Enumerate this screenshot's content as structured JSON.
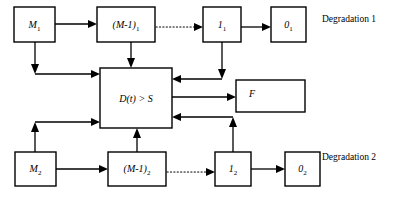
{
  "diagram": {
    "background_color": "#ffffff",
    "line_color": "#000000",
    "boxes": [
      {
        "id": "m1",
        "label": "M",
        "sub": "1",
        "x": 14,
        "y": 7,
        "w": 41,
        "h": 35
      },
      {
        "id": "mm1_1",
        "label": "(M-1)",
        "sub": "1",
        "x": 97,
        "y": 7,
        "w": 58,
        "h": 35
      },
      {
        "id": "one_1",
        "label": "1",
        "sub": "1",
        "x": 203,
        "y": 7,
        "w": 38,
        "h": 35
      },
      {
        "id": "zero_1",
        "label": "0",
        "sub": "1",
        "x": 271,
        "y": 7,
        "w": 35,
        "h": 35
      },
      {
        "id": "dts",
        "label": "D(t) > S",
        "sub": "",
        "x": 100,
        "y": 68,
        "w": 72,
        "h": 60
      },
      {
        "id": "f",
        "label": "F",
        "sub": "",
        "x": 236,
        "y": 80,
        "w": 69,
        "h": 32
      },
      {
        "id": "m2",
        "label": "M",
        "sub": "2",
        "x": 15,
        "y": 152,
        "w": 41,
        "h": 34
      },
      {
        "id": "mm1_2",
        "label": "(M-1)",
        "sub": "2",
        "x": 108,
        "y": 152,
        "w": 58,
        "h": 34
      },
      {
        "id": "one_2",
        "label": "1",
        "sub": "2",
        "x": 215,
        "y": 152,
        "w": 36,
        "h": 34
      },
      {
        "id": "zero_2",
        "label": "0",
        "sub": "2",
        "x": 285,
        "y": 152,
        "w": 35,
        "h": 34
      }
    ],
    "side_labels": [
      {
        "id": "degradation-1",
        "text": "Degradation 1",
        "x": 322,
        "y": 22
      },
      {
        "id": "degradation-2",
        "text": "Degradation 2",
        "x": 322,
        "y": 160
      }
    ],
    "connectors": [
      {
        "id": "m1-to-mm1-1",
        "style": "solid",
        "description": "M1 to (M-1)1"
      },
      {
        "id": "mm1-1-to-one-1",
        "style": "dotted",
        "description": "(M-1)1 to 1-1"
      },
      {
        "id": "one-1-to-zero-1",
        "style": "solid",
        "description": "1-1 to 0-1"
      },
      {
        "id": "m1-to-dts",
        "style": "solid",
        "description": "M1 down then right into D(t)>S"
      },
      {
        "id": "mm1-1-to-dts",
        "style": "solid",
        "description": "(M-1)1 down into D(t)>S top"
      },
      {
        "id": "one-1-to-dts",
        "style": "solid",
        "description": "1-1 down then left into D(t)>S"
      },
      {
        "id": "dts-to-f",
        "style": "solid",
        "description": "D(t)>S to F"
      },
      {
        "id": "m2-to-mm1-2",
        "style": "solid",
        "description": "M2 to (M-1)2"
      },
      {
        "id": "mm1-2-to-one-2",
        "style": "dotted",
        "description": "(M-1)2 to 1-2"
      },
      {
        "id": "one-2-to-zero-2",
        "style": "solid",
        "description": "1-2 to 0-2"
      },
      {
        "id": "m2-to-dts",
        "style": "solid",
        "description": "M2 up then right into D(t)>S"
      },
      {
        "id": "mm1-2-to-dts",
        "style": "solid",
        "description": "(M-1)2 up into D(t)>S bottom"
      },
      {
        "id": "one-2-to-dts",
        "style": "solid",
        "description": "1-2 up then left into D(t)>S"
      }
    ]
  }
}
